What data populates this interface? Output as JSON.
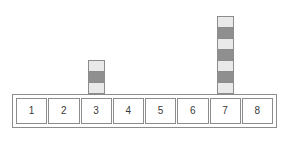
{
  "figure": {
    "name": "hash-table-chaining-diagram",
    "background_color": "#ffffff",
    "border_color": "#8c8c8c"
  },
  "bucket_row": {
    "name": "bucket-row",
    "cells": [
      {
        "label": "1",
        "stack_count": 0
      },
      {
        "label": "2",
        "stack_count": 0
      },
      {
        "label": "3",
        "stack_count": 3
      },
      {
        "label": "4",
        "stack_count": 0
      },
      {
        "label": "5",
        "stack_count": 0
      },
      {
        "label": "6",
        "stack_count": 0
      },
      {
        "label": "7",
        "stack_count": 7
      },
      {
        "label": "8",
        "stack_count": 0
      }
    ]
  },
  "stacks": [
    {
      "over_cell": "3",
      "count": 3,
      "blocks": [
        {
          "shade": "light",
          "color": "#e9e9e9"
        },
        {
          "shade": "dark",
          "color": "#8f8f8f"
        },
        {
          "shade": "light",
          "color": "#e9e9e9"
        }
      ]
    },
    {
      "over_cell": "7",
      "count": 7,
      "blocks": [
        {
          "shade": "light",
          "color": "#e9e9e9"
        },
        {
          "shade": "dark",
          "color": "#8f8f8f"
        },
        {
          "shade": "light",
          "color": "#e9e9e9"
        },
        {
          "shade": "dark",
          "color": "#8f8f8f"
        },
        {
          "shade": "light",
          "color": "#e9e9e9"
        },
        {
          "shade": "dark",
          "color": "#8f8f8f"
        },
        {
          "shade": "light",
          "color": "#e9e9e9"
        }
      ]
    }
  ],
  "chart_data": {
    "type": "bar",
    "title": "",
    "xlabel": "",
    "ylabel": "",
    "categories": [
      "1",
      "2",
      "3",
      "4",
      "5",
      "6",
      "7",
      "8"
    ],
    "values": [
      0,
      0,
      3,
      0,
      0,
      0,
      7,
      0
    ],
    "ylim": [
      0,
      7
    ],
    "grid": false,
    "legend": null
  }
}
